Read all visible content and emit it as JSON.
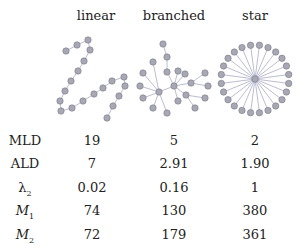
{
  "columns": [
    "linear",
    "branched",
    "star"
  ],
  "rows": [
    {
      "label": "MLD",
      "sub": "",
      "italic": false,
      "values": [
        "19",
        "5",
        "2"
      ]
    },
    {
      "label": "ALD",
      "sub": "",
      "italic": false,
      "values": [
        "7",
        "2.91",
        "1.90"
      ]
    },
    {
      "label": "λ",
      "sub": "2",
      "italic": false,
      "values": [
        "0.02",
        "0.16",
        "1"
      ]
    },
    {
      "label": "M",
      "sub": "1",
      "italic": true,
      "values": [
        "74",
        "130",
        "380"
      ]
    },
    {
      "label": "M",
      "sub": "2",
      "italic": true,
      "values": [
        "72",
        "179",
        "361"
      ]
    }
  ],
  "colors": {
    "node_fill": "#a8a8b4",
    "node_stroke": "#7a7a88",
    "edge": "#b4b6cc"
  },
  "graphs": {
    "linear": {
      "node_count": 20,
      "structure": "path"
    },
    "branched": {
      "node_count": 23,
      "structure": "tree"
    },
    "star": {
      "node_count": 25,
      "structure": "star",
      "leaves": 24
    }
  }
}
